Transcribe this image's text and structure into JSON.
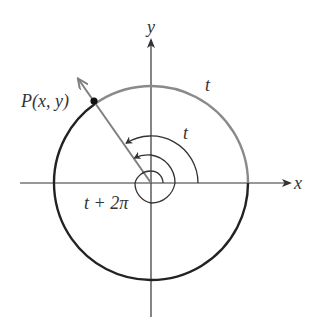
{
  "diagram": {
    "labels": {
      "x_axis": "x",
      "y_axis": "y",
      "point": "P(x, y)",
      "outer_arc": "t",
      "inner_arc": "t",
      "spiral": "t + 2π"
    },
    "colors": {
      "axis": "#333333",
      "gray_arc": "#8a8a8a",
      "black_arc": "#222222",
      "ray": "#7f7f7f",
      "point": "#111111",
      "text": "#333333"
    }
  }
}
